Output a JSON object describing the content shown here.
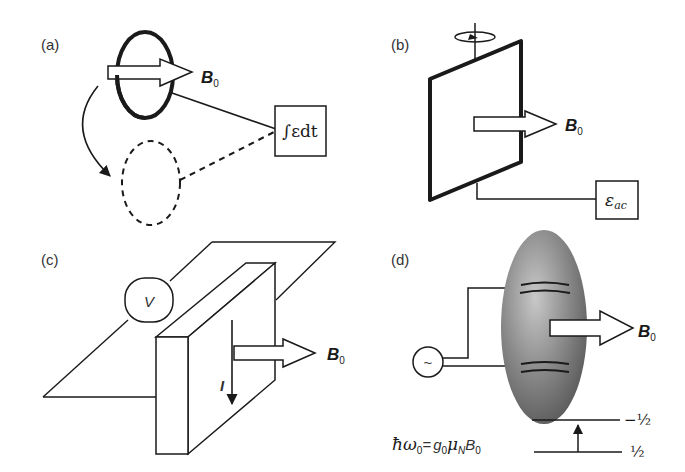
{
  "figure": {
    "panels": [
      {
        "label": "(a)",
        "description": "Rotating coil (search coil) flipped in field; integrated EMF",
        "field_label": "B",
        "field_subscript": "0",
        "box_text": "∫εdt"
      },
      {
        "label": "(b)",
        "description": "Rotating coil generator producing AC EMF",
        "field_label": "B",
        "field_subscript": "0",
        "box_text": "ε",
        "box_subscript": "ac"
      },
      {
        "label": "(c)",
        "description": "Hall effect probe",
        "voltmeter_label": "V",
        "current_label": "I",
        "field_label": "B",
        "field_subscript": "0"
      },
      {
        "label": "(d)",
        "description": "NMR probe with RF coil and sample",
        "source_symbol": "~",
        "field_label": "B",
        "field_subscript": "0",
        "equation": {
          "lhs": "ħω",
          "lhs_sub": "0",
          "eq": "=",
          "g": "g",
          "g_sub": "0",
          "mu": "μ",
          "mu_sub": "N",
          "b": "B",
          "b_sub": "0"
        },
        "levels": {
          "upper": "−½",
          "lower": "½"
        }
      }
    ]
  }
}
